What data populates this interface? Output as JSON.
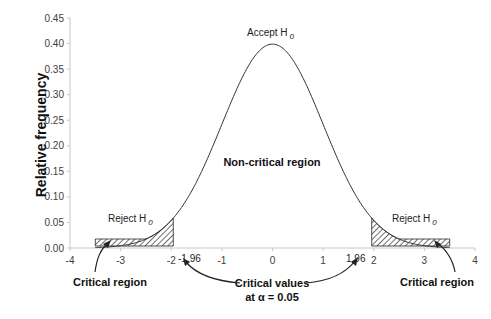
{
  "chart_data": {
    "type": "line",
    "title": "",
    "xlabel": "",
    "ylabel": "Relative frequency",
    "xlim": [
      -4,
      4
    ],
    "ylim": [
      0,
      0.45
    ],
    "x_ticks": [
      "-4",
      "-3",
      "-2",
      "-1",
      "0",
      "1",
      "2",
      "3",
      "4"
    ],
    "y_ticks": [
      "0.00",
      "0.05",
      "0.10",
      "0.15",
      "0.20",
      "0.25",
      "0.30",
      "0.35",
      "0.40",
      "0.45"
    ],
    "grid": false,
    "legend": null,
    "series": [
      {
        "name": "Standard normal density",
        "x": [
          -3.5,
          -3,
          -2.5,
          -2,
          -1.5,
          -1,
          -0.5,
          0,
          0.5,
          1,
          1.5,
          2,
          2.5,
          3,
          3.5
        ],
        "values": [
          0.0009,
          0.0044,
          0.0175,
          0.054,
          0.1295,
          0.242,
          0.3521,
          0.3989,
          0.3521,
          0.242,
          0.1295,
          0.054,
          0.0175,
          0.0044,
          0.0009
        ]
      }
    ],
    "shaded_regions": [
      {
        "name": "Critical region (left)",
        "x_from": -3.5,
        "x_to": -1.96
      },
      {
        "name": "Critical region (right)",
        "x_from": 1.96,
        "x_to": 3.5
      }
    ],
    "annotations": {
      "accept": "Accept H",
      "accept_sub": "0",
      "reject_left": "Reject H",
      "reject_left_sub": "0",
      "reject_right": "Reject H",
      "reject_right_sub": "0",
      "non_critical": "Non-critical region",
      "critical_left": "Critical region",
      "critical_right": "Critical region",
      "crit_val_left": "-1.96",
      "crit_val_right": "1.96",
      "critical_values_line1": "Critical values",
      "critical_values_line2": "at α = 0.05"
    }
  }
}
